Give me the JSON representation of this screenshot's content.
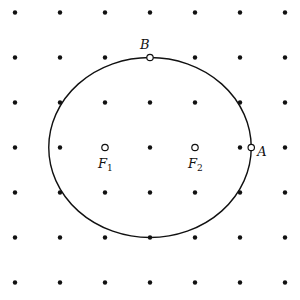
{
  "diagram": {
    "colors": {
      "ink": "#111111",
      "background": "#ffffff"
    },
    "grid": {
      "columns": 7,
      "rows": 7,
      "unit": 1
    },
    "ellipse": {
      "center": [
        3,
        3
      ],
      "semi_major": 2.25,
      "semi_minor": 2.0
    },
    "points": [
      {
        "id": "B",
        "label": "B",
        "subscript": "",
        "grid": [
          3,
          1
        ],
        "style": "open",
        "label_pos": "above-left"
      },
      {
        "id": "A",
        "label": "A",
        "subscript": "",
        "grid": [
          5.25,
          3
        ],
        "style": "open",
        "label_pos": "right"
      },
      {
        "id": "F1",
        "label": "F",
        "subscript": "1",
        "grid": [
          2,
          3
        ],
        "style": "open",
        "label_pos": "below"
      },
      {
        "id": "F2",
        "label": "F",
        "subscript": "2",
        "grid": [
          4,
          3
        ],
        "style": "open",
        "label_pos": "below"
      }
    ]
  }
}
